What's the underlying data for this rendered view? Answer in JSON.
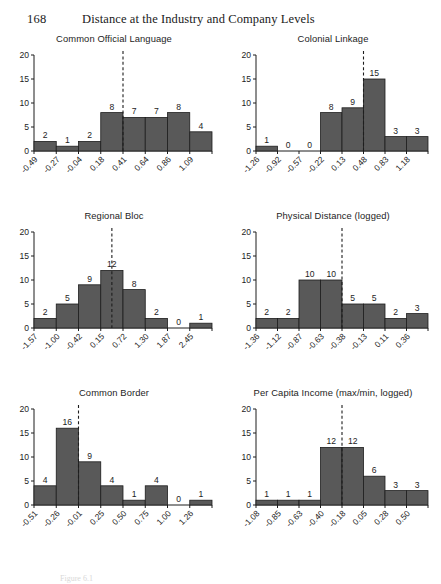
{
  "running_head": {
    "folio": "168",
    "title": "Distance at the Industry and Company Levels"
  },
  "caption": "Figure 6.1",
  "style": {
    "bar_fill": "#595959",
    "bar_stroke": "#1d1d1d",
    "axis_color": "#1d1d1d",
    "dashed_color": "#1d1d1d",
    "page_background": "#ffffff"
  },
  "chart_data": [
    {
      "type": "bar",
      "title": "Common Official Language",
      "xlabel": "",
      "ylabel": "",
      "ylim": [
        0,
        20
      ],
      "yticks": [
        0,
        5,
        10,
        15,
        20
      ],
      "grid": false,
      "legend": "none",
      "categories": [
        "-0.49",
        "-0.27",
        "-0.04",
        "0.18",
        "0.41",
        "0.64",
        "0.86",
        "1.09"
      ],
      "values": [
        2,
        1,
        2,
        8,
        7,
        7,
        8,
        4
      ],
      "bar_labels": [
        "2",
        "1",
        "2",
        "8",
        "7",
        "7",
        "8",
        "4"
      ],
      "reference_line": {
        "at_category_index": 4,
        "position": "left-edge",
        "style": "dashed"
      }
    },
    {
      "type": "bar",
      "title": "Colonial Linkage",
      "xlabel": "",
      "ylabel": "",
      "ylim": [
        0,
        20
      ],
      "yticks": [
        0,
        5,
        10,
        15,
        20
      ],
      "grid": false,
      "legend": "none",
      "categories": [
        "-1.26",
        "-0.92",
        "-0.57",
        "-0.22",
        "0.13",
        "0.48",
        "0.83",
        "1.18"
      ],
      "values": [
        1,
        0,
        0,
        8,
        9,
        15,
        3,
        3
      ],
      "bar_labels": [
        "1",
        "0",
        "0",
        "8",
        "9",
        "15",
        "3",
        "3"
      ],
      "reference_line": {
        "at_category_index": 5,
        "position": "left-edge",
        "style": "dashed"
      }
    },
    {
      "type": "bar",
      "title": "Regional Bloc",
      "xlabel": "",
      "ylabel": "",
      "ylim": [
        0,
        20
      ],
      "yticks": [
        0,
        5,
        10,
        15,
        20
      ],
      "grid": false,
      "legend": "none",
      "categories": [
        "-1.57",
        "-1.00",
        "-0.42",
        "0.15",
        "0.72",
        "1.30",
        "1.87",
        "2.45"
      ],
      "values": [
        2,
        5,
        9,
        12,
        8,
        2,
        0,
        1
      ],
      "bar_labels": [
        "2",
        "5",
        "9",
        "12",
        "8",
        "2",
        "0",
        "1"
      ],
      "reference_line": {
        "at_category_index": 3,
        "position": "center",
        "style": "dashed"
      }
    },
    {
      "type": "bar",
      "title": "Physical Distance (logged)",
      "xlabel": "",
      "ylabel": "",
      "ylim": [
        0,
        20
      ],
      "yticks": [
        0,
        5,
        10,
        15,
        20
      ],
      "grid": false,
      "legend": "none",
      "categories": [
        "-1.36",
        "-1.12",
        "-0.87",
        "-0.63",
        "-0.38",
        "-0.13",
        "0.11",
        "0.36"
      ],
      "values": [
        2,
        2,
        10,
        10,
        5,
        5,
        2,
        3
      ],
      "bar_labels": [
        "2",
        "2",
        "10",
        "10",
        "5",
        "5",
        "2",
        "3"
      ],
      "reference_line": {
        "at_category_index": 4,
        "position": "left-edge",
        "style": "dashed"
      }
    },
    {
      "type": "bar",
      "title": "Common Border",
      "xlabel": "",
      "ylabel": "",
      "ylim": [
        0,
        20
      ],
      "yticks": [
        0,
        5,
        10,
        15,
        20
      ],
      "grid": false,
      "legend": "none",
      "categories": [
        "-0.51",
        "-0.26",
        "-0.01",
        "0.25",
        "0.50",
        "0.75",
        "1.00",
        "1.26"
      ],
      "values": [
        4,
        16,
        9,
        4,
        1,
        4,
        0,
        1
      ],
      "bar_labels": [
        "4",
        "16",
        "9",
        "4",
        "1",
        "4",
        "0",
        "1"
      ],
      "reference_line": {
        "at_category_index": 2,
        "position": "left-edge",
        "style": "dashed"
      }
    },
    {
      "type": "bar",
      "title": "Per Capita Income (max/min, logged)",
      "xlabel": "",
      "ylabel": "",
      "ylim": [
        0,
        20
      ],
      "yticks": [
        0,
        5,
        10,
        15,
        20
      ],
      "grid": false,
      "legend": "none",
      "categories": [
        "-1.08",
        "-0.85",
        "-0.63",
        "-0.40",
        "-0.18",
        "0.05",
        "0.28",
        "0.50"
      ],
      "values": [
        1,
        1,
        1,
        12,
        12,
        6,
        3,
        3
      ],
      "bar_labels": [
        "1",
        "1",
        "1",
        "12",
        "12",
        "6",
        "3",
        "3"
      ],
      "reference_line": {
        "at_category_index": 4,
        "position": "left-edge",
        "style": "dashed"
      }
    }
  ]
}
